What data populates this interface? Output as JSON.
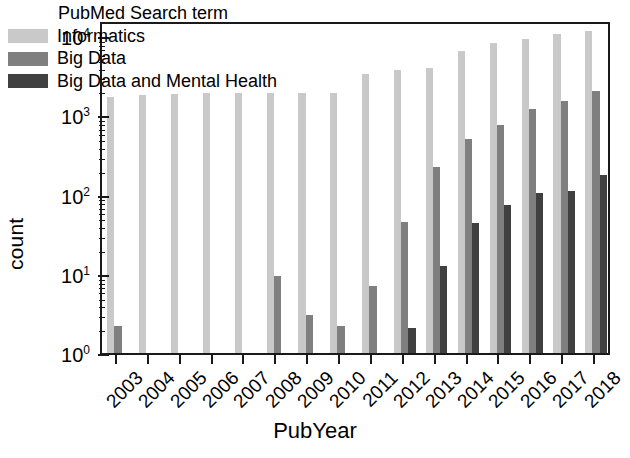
{
  "chart_data": {
    "type": "bar",
    "title": "",
    "xlabel": "PubYear",
    "ylabel": "count",
    "yscale": "log",
    "ylim": [
      0.7,
      16000
    ],
    "ytick_labels": [
      "10⁰",
      "10¹",
      "10²",
      "10³",
      "10⁴"
    ],
    "ytick_values": [
      1,
      10,
      100,
      1000,
      10000
    ],
    "grid": false,
    "legend_title": "PubMed Search term",
    "legend_position": "upper-left-inside",
    "categories": [
      "2003",
      "2004",
      "2005",
      "2006",
      "2007",
      "2008",
      "2009",
      "2010",
      "2011",
      "2012",
      "2013",
      "2014",
      "2015",
      "2016",
      "2017",
      "2018"
    ],
    "series": [
      {
        "name": "Informatics",
        "color": "#c9c9c9",
        "values": [
          1700,
          1800,
          1850,
          1900,
          1900,
          1900,
          1900,
          1900,
          3300,
          3700,
          4000,
          6500,
          8200,
          9200,
          10500,
          11500
        ]
      },
      {
        "name": "Big Data",
        "color": "#7f7f7f",
        "values": [
          2.2,
          1,
          0,
          0,
          0,
          9.5,
          3,
          2.2,
          7,
          45,
          220,
          500,
          760,
          1200,
          1500,
          2000
        ]
      },
      {
        "name": "Big Data and Mental Health",
        "color": "#404040",
        "values": [
          0,
          0,
          0,
          0,
          0,
          0,
          0,
          0,
          1,
          2.1,
          12.5,
          44,
          75,
          105,
          110,
          175
        ]
      }
    ]
  },
  "axis": {
    "y_title": "count",
    "x_title": "PubYear"
  }
}
